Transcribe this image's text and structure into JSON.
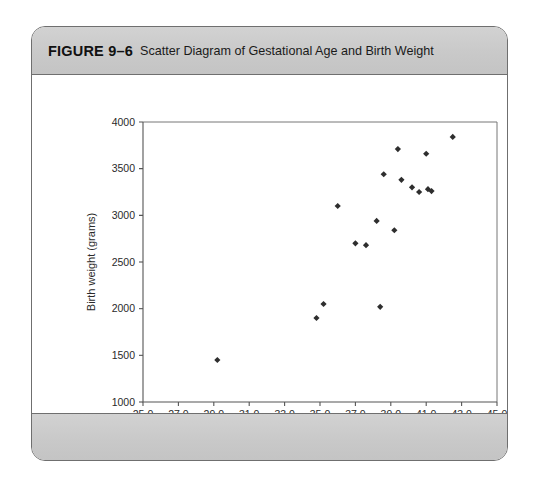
{
  "figure": {
    "number": "FIGURE 9–6",
    "caption": "Scatter Diagram of Gestational Age and Birth Weight"
  },
  "chart_data": {
    "type": "scatter",
    "title": "",
    "xlabel": "Gestational Age (weeks)",
    "ylabel": "Birth weight (grams)",
    "xlim": [
      25.0,
      45.0
    ],
    "ylim": [
      1000,
      4000
    ],
    "xticks": [
      25.0,
      27.0,
      29.0,
      31.0,
      33.0,
      35.0,
      37.0,
      39.0,
      41.0,
      43.0,
      45.0
    ],
    "xtick_labels": [
      "25.0",
      "27.0",
      "29.0",
      "31.0",
      "33.0",
      "35.0",
      "37.0",
      "39.0",
      "41.0",
      "43.0",
      "45.0"
    ],
    "yticks": [
      1000,
      1500,
      2000,
      2500,
      3000,
      3500,
      4000
    ],
    "ytick_labels": [
      "1000",
      "1500",
      "2000",
      "2500",
      "3000",
      "3500",
      "4000"
    ],
    "grid": false,
    "legend": null,
    "marker": "diamond",
    "marker_color": "#2e2e2e",
    "points": [
      {
        "x": 29.2,
        "y": 1450
      },
      {
        "x": 34.8,
        "y": 1900
      },
      {
        "x": 35.2,
        "y": 2050
      },
      {
        "x": 36.0,
        "y": 3100
      },
      {
        "x": 37.0,
        "y": 2700
      },
      {
        "x": 37.6,
        "y": 2680
      },
      {
        "x": 38.2,
        "y": 2940
      },
      {
        "x": 38.4,
        "y": 2020
      },
      {
        "x": 38.6,
        "y": 3440
      },
      {
        "x": 39.2,
        "y": 2840
      },
      {
        "x": 39.4,
        "y": 3710
      },
      {
        "x": 39.6,
        "y": 3380
      },
      {
        "x": 40.2,
        "y": 3300
      },
      {
        "x": 40.6,
        "y": 3250
      },
      {
        "x": 41.0,
        "y": 3660
      },
      {
        "x": 41.1,
        "y": 3280
      },
      {
        "x": 41.3,
        "y": 3260
      },
      {
        "x": 42.5,
        "y": 3840
      }
    ]
  }
}
